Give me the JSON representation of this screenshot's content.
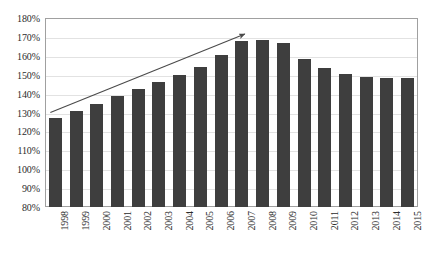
{
  "chart_data": {
    "type": "bar",
    "title": "",
    "xlabel": "",
    "ylabel": "",
    "categories": [
      "1998",
      "1999",
      "2000",
      "2001",
      "2002",
      "2003",
      "2004",
      "2005",
      "2006",
      "2007",
      "2008",
      "2009",
      "2010",
      "2011",
      "2012",
      "2013",
      "2014",
      "2015"
    ],
    "values": [
      127,
      131,
      134.5,
      139,
      142.5,
      146,
      150,
      154,
      160.5,
      168,
      168.5,
      167,
      158.5,
      153.5,
      150.5,
      149,
      148.5,
      148
    ],
    "values_display": [
      "127%",
      "131%",
      "134.5%",
      "139%",
      "142.5%",
      "146%",
      "150%",
      "154%",
      "160.5%",
      "168%",
      "168.5%",
      "167%",
      "158.5%",
      "153.5%",
      "150.5%",
      "149%",
      "148.5%",
      "148%"
    ],
    "ylim": [
      80,
      180
    ],
    "ytick_step": 10,
    "ytick_labels": [
      "180%",
      "170%",
      "160%",
      "150%",
      "140%",
      "130%",
      "120%",
      "110%",
      "100%",
      "90%",
      "80%"
    ],
    "ytick_values": [
      180,
      170,
      160,
      150,
      140,
      130,
      120,
      110,
      100,
      90,
      80
    ],
    "grid": true,
    "grid_axis": "y",
    "legend": false,
    "bar_color": "#3e3e3e",
    "grid_color": "#e2e2e2",
    "frame_color": "#a0a0a0",
    "background_color": "#ffffff",
    "annotations": [
      {
        "name": "upward-trend-arrow",
        "type": "arrow",
        "color": "#4a4a4a",
        "start": {
          "category": "1998",
          "value": 130
        },
        "end": {
          "category": "2007",
          "value": 171.5
        }
      }
    ]
  }
}
